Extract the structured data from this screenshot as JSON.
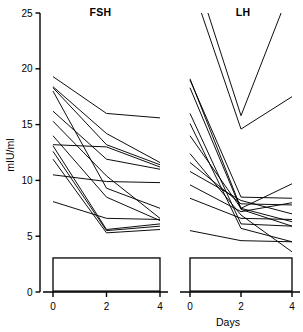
{
  "figure": {
    "y_axis_label": "mIU/ml",
    "x_axis_label": "Days"
  },
  "panels": [
    {
      "title": "FSH",
      "annotation_line1": "Ethinyl estradiol,",
      "annotation_line2": "0.2 mg"
    },
    {
      "title": "LH",
      "annotation_line1": "Ethinyl estradiol,",
      "annotation_line2": "0.2 mg"
    }
  ],
  "axis": {
    "y_ticks": [
      "0",
      "5",
      "10",
      "15",
      "20",
      "25"
    ],
    "x_ticks": [
      "0",
      "2",
      "4"
    ]
  },
  "colors": {
    "ink": "#000000",
    "paper": "#ffffff"
  },
  "chart_data": {
    "type": "line",
    "title": "",
    "xlabel": "Days",
    "ylabel": "mIU/ml",
    "ylim": [
      0,
      25
    ],
    "xlim": [
      0,
      4
    ],
    "grid": false,
    "legend": "none",
    "x": [
      0,
      2,
      4
    ],
    "annotations": [
      {
        "panel": "FSH",
        "text": "Ethinyl estradiol, 0.2 mg",
        "x_span": [
          0,
          4
        ]
      },
      {
        "panel": "LH",
        "text": "Ethinyl estradiol, 0.2 mg",
        "x_span": [
          0,
          4
        ]
      }
    ],
    "panels": [
      {
        "name": "FSH",
        "series": [
          {
            "name": "s1",
            "values": [
              19.3,
              16.0,
              15.6
            ]
          },
          {
            "name": "s2",
            "values": [
              18.4,
              14.2,
              11.6
            ]
          },
          {
            "name": "s3",
            "values": [
              18.3,
              13.2,
              11.4
            ]
          },
          {
            "name": "s4",
            "values": [
              18.0,
              9.3,
              7.5
            ]
          },
          {
            "name": "s5",
            "values": [
              16.2,
              11.9,
              11.0
            ]
          },
          {
            "name": "s6",
            "values": [
              15.3,
              10.4,
              6.6
            ]
          },
          {
            "name": "s7",
            "values": [
              14.0,
              8.5,
              6.4
            ]
          },
          {
            "name": "s8",
            "values": [
              13.2,
              13.0,
              11.2
            ]
          },
          {
            "name": "s9",
            "values": [
              13.1,
              5.6,
              6.1
            ]
          },
          {
            "name": "s10",
            "values": [
              12.6,
              5.5,
              5.9
            ]
          },
          {
            "name": "s11",
            "values": [
              11.9,
              5.3,
              5.6
            ]
          },
          {
            "name": "s12",
            "values": [
              10.5,
              9.9,
              9.8
            ]
          },
          {
            "name": "s13",
            "values": [
              8.1,
              6.6,
              6.5
            ]
          }
        ]
      },
      {
        "name": "LH",
        "series": [
          {
            "name": "t1",
            "values": [
              30.0,
              15.8,
              27.5
            ]
          },
          {
            "name": "t2",
            "values": [
              28.0,
              14.6,
              17.5
            ]
          },
          {
            "name": "t3",
            "values": [
              19.1,
              7.5,
              6.3
            ]
          },
          {
            "name": "t4",
            "values": [
              19.0,
              8.5,
              8.4
            ]
          },
          {
            "name": "t5",
            "values": [
              18.3,
              7.4,
              5.9
            ]
          },
          {
            "name": "t6",
            "values": [
              16.0,
              6.1,
              5.9
            ]
          },
          {
            "name": "t7",
            "values": [
              15.1,
              5.7,
              4.5
            ]
          },
          {
            "name": "t8",
            "values": [
              14.0,
              7.5,
              9.7
            ]
          },
          {
            "name": "t9",
            "values": [
              12.4,
              6.9,
              3.6
            ]
          },
          {
            "name": "t10",
            "values": [
              11.6,
              7.9,
              7.8
            ]
          },
          {
            "name": "t11",
            "values": [
              10.8,
              8.2,
              7.0
            ]
          },
          {
            "name": "t12",
            "values": [
              9.6,
              7.2,
              8.0
            ]
          },
          {
            "name": "t13",
            "values": [
              8.4,
              6.6,
              6.5
            ]
          },
          {
            "name": "t14",
            "values": [
              5.5,
              4.6,
              4.5
            ]
          }
        ]
      }
    ]
  }
}
